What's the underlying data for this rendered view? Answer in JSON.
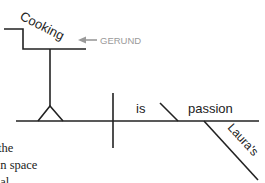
{
  "diagram": {
    "subject_word": "Cooking",
    "label": "GERUND",
    "verb": "is",
    "predicate_noun": "passion",
    "modifier": "Laura's",
    "colors": {
      "line": "#222222",
      "label": "#9a9a9a"
    }
  },
  "body_text": {
    "lines": [
      "the",
      "un space",
      "ual"
    ]
  }
}
